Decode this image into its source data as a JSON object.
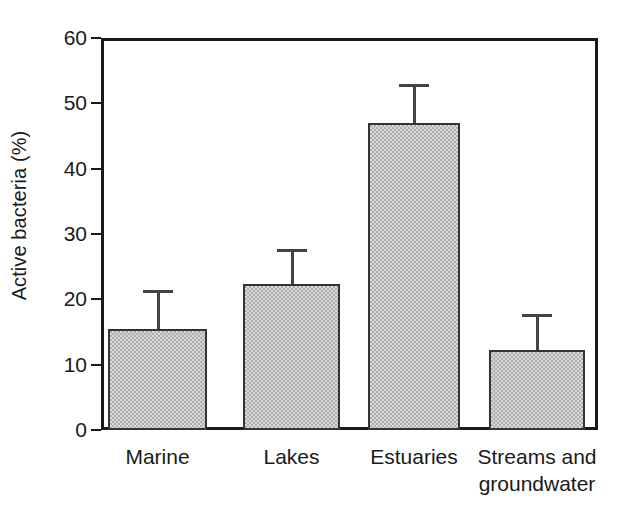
{
  "chart_data": {
    "type": "bar",
    "title": "",
    "xlabel": "",
    "ylabel": "Active bacteria (%)",
    "categories": [
      "Marine",
      "Lakes",
      "Estuaries",
      "Streams and\ngroundwater"
    ],
    "values": [
      15.5,
      22.3,
      47.0,
      12.2
    ],
    "errors_upper": [
      21.5,
      27.7,
      53.0,
      17.8
    ],
    "error_bars": [
      6.0,
      5.4,
      6.0,
      5.6
    ],
    "ylim": [
      0,
      60
    ],
    "yticks": [
      0,
      10,
      20,
      30,
      40,
      50,
      60
    ],
    "ytick_labels": [
      "0",
      "10",
      "20",
      "30",
      "40",
      "50",
      "60"
    ],
    "grid": false,
    "legend": null,
    "bar_fill_color": "#adadad",
    "bar_edge_color": "#333333",
    "axis_color": "#1a1a1a",
    "error_bar_color": "#444444",
    "background_color": "#ffffff"
  },
  "axis": {
    "y_title": "Active bacteria (%)"
  }
}
